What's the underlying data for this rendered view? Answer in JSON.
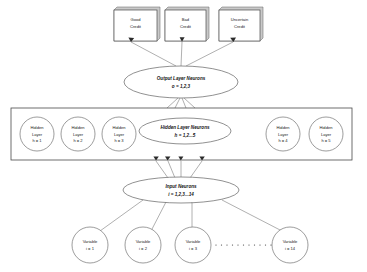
{
  "diagram": {
    "type": "neural-network-architecture",
    "title_present": false,
    "background_color": "#ffffff",
    "line_color": "#6e6e6e",
    "box_fill": "#ffffff",
    "box_shadow_fill": "#c9c9c9"
  },
  "output_boxes": [
    {
      "line1": "Good",
      "line2": "Credit"
    },
    {
      "line1": "Bad",
      "line2": "Credit"
    },
    {
      "line1": "Uncertain",
      "line2": "Credit"
    }
  ],
  "output_layer": {
    "line1": "Output Layer Neurons",
    "line2": "o = 1,2,3"
  },
  "hidden_layer_group": {
    "line1": "Hidden Layer Neurons",
    "line2": "h = 1,2...5"
  },
  "hidden_nodes": [
    {
      "line1": "Hidden",
      "line2": "Layer",
      "line3": "h = 1"
    },
    {
      "line1": "Hidden",
      "line2": "Layer",
      "line3": "h = 2"
    },
    {
      "line1": "Hidden",
      "line2": "Layer",
      "line3": "h = 3"
    },
    {
      "line1": "Hidden",
      "line2": "Layer",
      "line3": "h = 4"
    },
    {
      "line1": "Hidden",
      "line2": "Layer",
      "line3": "h = 5"
    }
  ],
  "input_layer": {
    "line1": "Input Neurons",
    "line2": "i = 1,2,3...14"
  },
  "variable_nodes": [
    {
      "line1": "Variable",
      "line2": "i = 1"
    },
    {
      "line1": "Variable",
      "line2": "i = 2"
    },
    {
      "line1": "Variable",
      "line2": "i = 3"
    },
    {
      "line1": "Variable",
      "line2": "i = 14"
    }
  ],
  "ellipsis": {
    "label": "..........."
  }
}
